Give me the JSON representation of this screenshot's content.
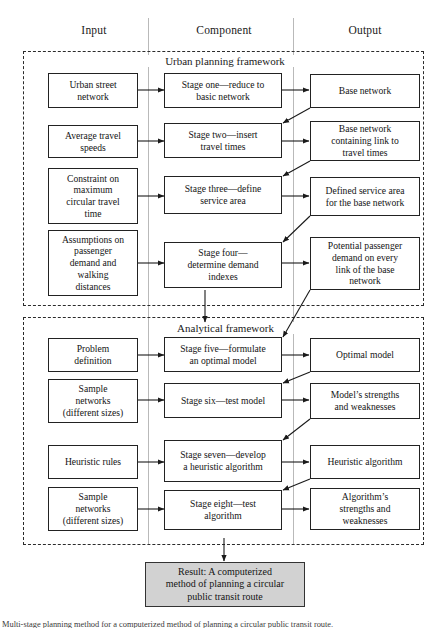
{
  "figure": {
    "caption": "Multi-stage planning method for a computerized method of planning a circular public transit route."
  },
  "columns": [
    {
      "name": "input",
      "label": "Input"
    },
    {
      "name": "component",
      "label": "Component"
    },
    {
      "name": "output",
      "label": "Output"
    }
  ],
  "frameworks": [
    {
      "name": "urban-planning-framework",
      "title": "Urban planning framework"
    },
    {
      "name": "analytical-framework",
      "title": "Analytical framework"
    }
  ],
  "inputs": [
    {
      "id": "urban-street-network",
      "lines": [
        "Urban street",
        "network"
      ]
    },
    {
      "id": "average-travel-speeds",
      "lines": [
        "Average travel",
        "speeds"
      ]
    },
    {
      "id": "constraint-max-circular-travel-time",
      "lines": [
        "Constraint on",
        "maximum",
        "circular travel",
        "time"
      ]
    },
    {
      "id": "assumptions-demand-walking",
      "lines": [
        "Assumptions on",
        "passenger",
        "demand and",
        "walking",
        "distances"
      ]
    },
    {
      "id": "problem-definition",
      "lines": [
        "Problem",
        "definition"
      ]
    },
    {
      "id": "sample-networks-1",
      "lines": [
        "Sample",
        "networks",
        "(different sizes)"
      ]
    },
    {
      "id": "heuristic-rules",
      "lines": [
        "Heuristic rules"
      ]
    },
    {
      "id": "sample-networks-2",
      "lines": [
        "Sample",
        "networks",
        "(different sizes)"
      ]
    }
  ],
  "components": [
    {
      "id": "stage-one",
      "lines": [
        "Stage one—reduce to",
        "basic network"
      ]
    },
    {
      "id": "stage-two",
      "lines": [
        "Stage two—insert",
        "travel times"
      ]
    },
    {
      "id": "stage-three",
      "lines": [
        "Stage three—define",
        "service area"
      ]
    },
    {
      "id": "stage-four",
      "lines": [
        "Stage four—",
        "determine demand",
        "indexes"
      ]
    },
    {
      "id": "stage-five",
      "lines": [
        "Stage five—formulate",
        "an optimal model"
      ]
    },
    {
      "id": "stage-six",
      "lines": [
        "Stage six—test model"
      ]
    },
    {
      "id": "stage-seven",
      "lines": [
        "Stage seven—develop",
        "a heuristic algorithm"
      ]
    },
    {
      "id": "stage-eight",
      "lines": [
        "Stage eight—test",
        "algorithm"
      ]
    }
  ],
  "outputs": [
    {
      "id": "base-network",
      "lines": [
        "Base network"
      ]
    },
    {
      "id": "base-network-with-travel-times",
      "lines": [
        "Base network",
        "containing link to",
        "travel times"
      ]
    },
    {
      "id": "defined-service-area",
      "lines": [
        "Defined service area",
        "for the base network"
      ]
    },
    {
      "id": "potential-passenger-demand",
      "lines": [
        "Potential passenger",
        "demand on every",
        "link of the base",
        "network"
      ]
    },
    {
      "id": "optimal-model",
      "lines": [
        "Optimal model"
      ]
    },
    {
      "id": "model-strengths-weaknesses",
      "lines": [
        "Model’s strengths",
        "and weaknesses"
      ]
    },
    {
      "id": "heuristic-algorithm",
      "lines": [
        "Heuristic algorithm"
      ]
    },
    {
      "id": "algorithm-strengths-weaknesses",
      "lines": [
        "Algorithm’s",
        "strengths and",
        "weaknesses"
      ]
    }
  ],
  "result": {
    "id": "result-box",
    "lines": [
      "Result: A computerized",
      "method of planning a circular",
      "public transit route"
    ],
    "fill": "#d2d2d2"
  },
  "colors": {
    "box_border": "#222222",
    "frame_border": "#2b2b2b",
    "divider": "#b9b9b9",
    "arrow": "#1a1a1a",
    "result_fill": "#d2d2d2",
    "background": "#ffffff"
  }
}
